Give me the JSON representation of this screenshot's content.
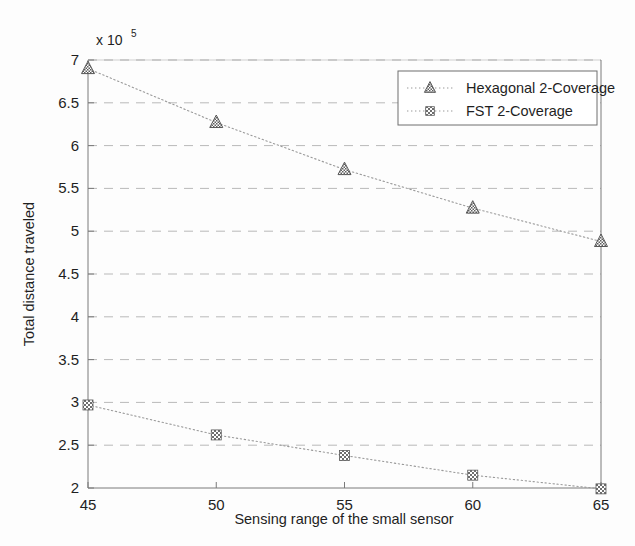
{
  "chart_data": {
    "type": "line",
    "title": "",
    "xlabel": "Sensing range of the small sensor",
    "ylabel": "Total distance traveled",
    "y_exponent_label": "x 10",
    "y_exponent_power": "5",
    "y_scale_factor": 100000,
    "x": [
      45,
      50,
      55,
      60,
      65
    ],
    "xlim": [
      45,
      65
    ],
    "ylim": [
      2,
      7
    ],
    "xticks": [
      "45",
      "50",
      "55",
      "60",
      "65"
    ],
    "yticks": [
      "2",
      "2.5",
      "3",
      "3.5",
      "4",
      "4.5",
      "5",
      "5.5",
      "6",
      "6.5",
      "7"
    ],
    "ytick_values": [
      2,
      2.5,
      3,
      3.5,
      4,
      4.5,
      5,
      5.5,
      6,
      6.5,
      7
    ],
    "grid": true,
    "grid_axis": "y",
    "legend_position": "top-right",
    "series": [
      {
        "name": "Hexagonal 2-Coverage",
        "marker": "triangle",
        "color": "#8a8a8a",
        "values": [
          6.9,
          6.27,
          5.72,
          5.27,
          4.88
        ]
      },
      {
        "name": "FST 2-Coverage",
        "marker": "square",
        "color": "#8a8a8a",
        "values": [
          2.97,
          2.62,
          2.38,
          2.15,
          1.99
        ]
      }
    ]
  },
  "legend": {
    "entries": [
      {
        "label": "Hexagonal 2-Coverage"
      },
      {
        "label": "FST 2-Coverage"
      }
    ]
  }
}
